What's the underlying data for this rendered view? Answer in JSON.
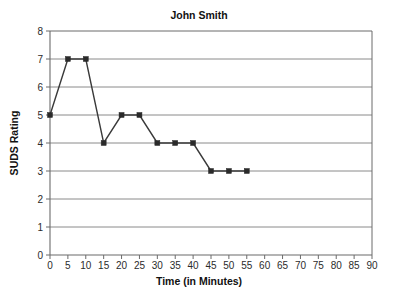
{
  "chart_data": {
    "type": "line",
    "title": "John Smith",
    "xlabel": "Time (in Minutes)",
    "ylabel": "SUDS Rating",
    "x": [
      0,
      5,
      10,
      15,
      20,
      25,
      30,
      35,
      40,
      45,
      50,
      55
    ],
    "values": [
      5,
      7,
      7,
      4,
      5,
      5,
      4,
      4,
      4,
      3,
      3,
      3
    ],
    "series": [
      {
        "name": "SUDS Rating",
        "values": [
          5,
          7,
          7,
          4,
          5,
          5,
          4,
          4,
          4,
          3,
          3,
          3
        ]
      }
    ],
    "xlim": [
      0,
      90
    ],
    "ylim": [
      0,
      8
    ],
    "xticks": [
      0,
      5,
      10,
      15,
      20,
      25,
      30,
      35,
      40,
      45,
      50,
      55,
      60,
      65,
      70,
      75,
      80,
      85,
      90
    ],
    "yticks": [
      0,
      1,
      2,
      3,
      4,
      5,
      6,
      7,
      8
    ],
    "xtick_labels": [
      "0",
      "5",
      "10",
      "15",
      "20",
      "25",
      "30",
      "35",
      "40",
      "45",
      "50",
      "55",
      "60",
      "65",
      "70",
      "75",
      "80",
      "85",
      "90"
    ],
    "ytick_labels": [
      "0",
      "1",
      "2",
      "3",
      "4",
      "5",
      "6",
      "7",
      "8"
    ],
    "grid": "horizontal",
    "legend": "none",
    "marker": "square",
    "colors": {
      "line": "#3a3a3a",
      "marker": "#2a2a2a",
      "grid": "#8a8a8a",
      "axis": "#6b6b6b",
      "background": "#ffffff",
      "text": "#111111"
    }
  }
}
